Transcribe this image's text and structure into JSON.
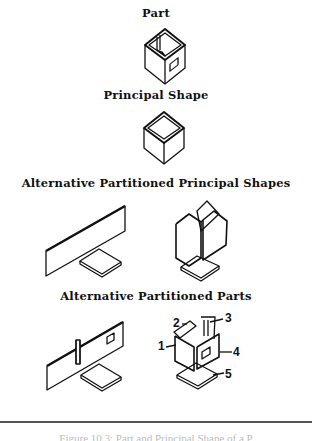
{
  "figure": {
    "sections": [
      {
        "title": "Part"
      },
      {
        "title": "Principal Shape"
      },
      {
        "title": "Alternative Partitioned Principal Shapes"
      },
      {
        "title": "Alternative Partitioned Parts"
      }
    ],
    "callouts": [
      "1",
      "2",
      "3",
      "4",
      "5"
    ],
    "caption": "Figure 10.3: Part and Principal Shape of a P"
  }
}
